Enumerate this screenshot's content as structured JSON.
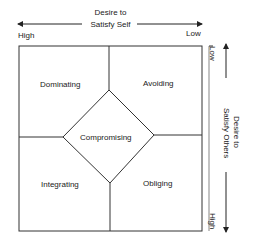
{
  "diagram": {
    "top_axis": {
      "label_line1": "Desire to",
      "label_line2": "Satisfy Self",
      "left_end": "High",
      "right_end": "Low"
    },
    "right_axis": {
      "label_line1": "Desire to",
      "label_line2": "Satisfy Others",
      "top_end": "Low",
      "bottom_end": "High"
    },
    "quadrants": {
      "top_left": "Dominating",
      "top_right": "Avoiding",
      "bottom_left": "Integrating",
      "bottom_right": "Obliging",
      "center": "Compromising"
    },
    "colors": {
      "line": "#333333",
      "background": "#ffffff"
    }
  }
}
